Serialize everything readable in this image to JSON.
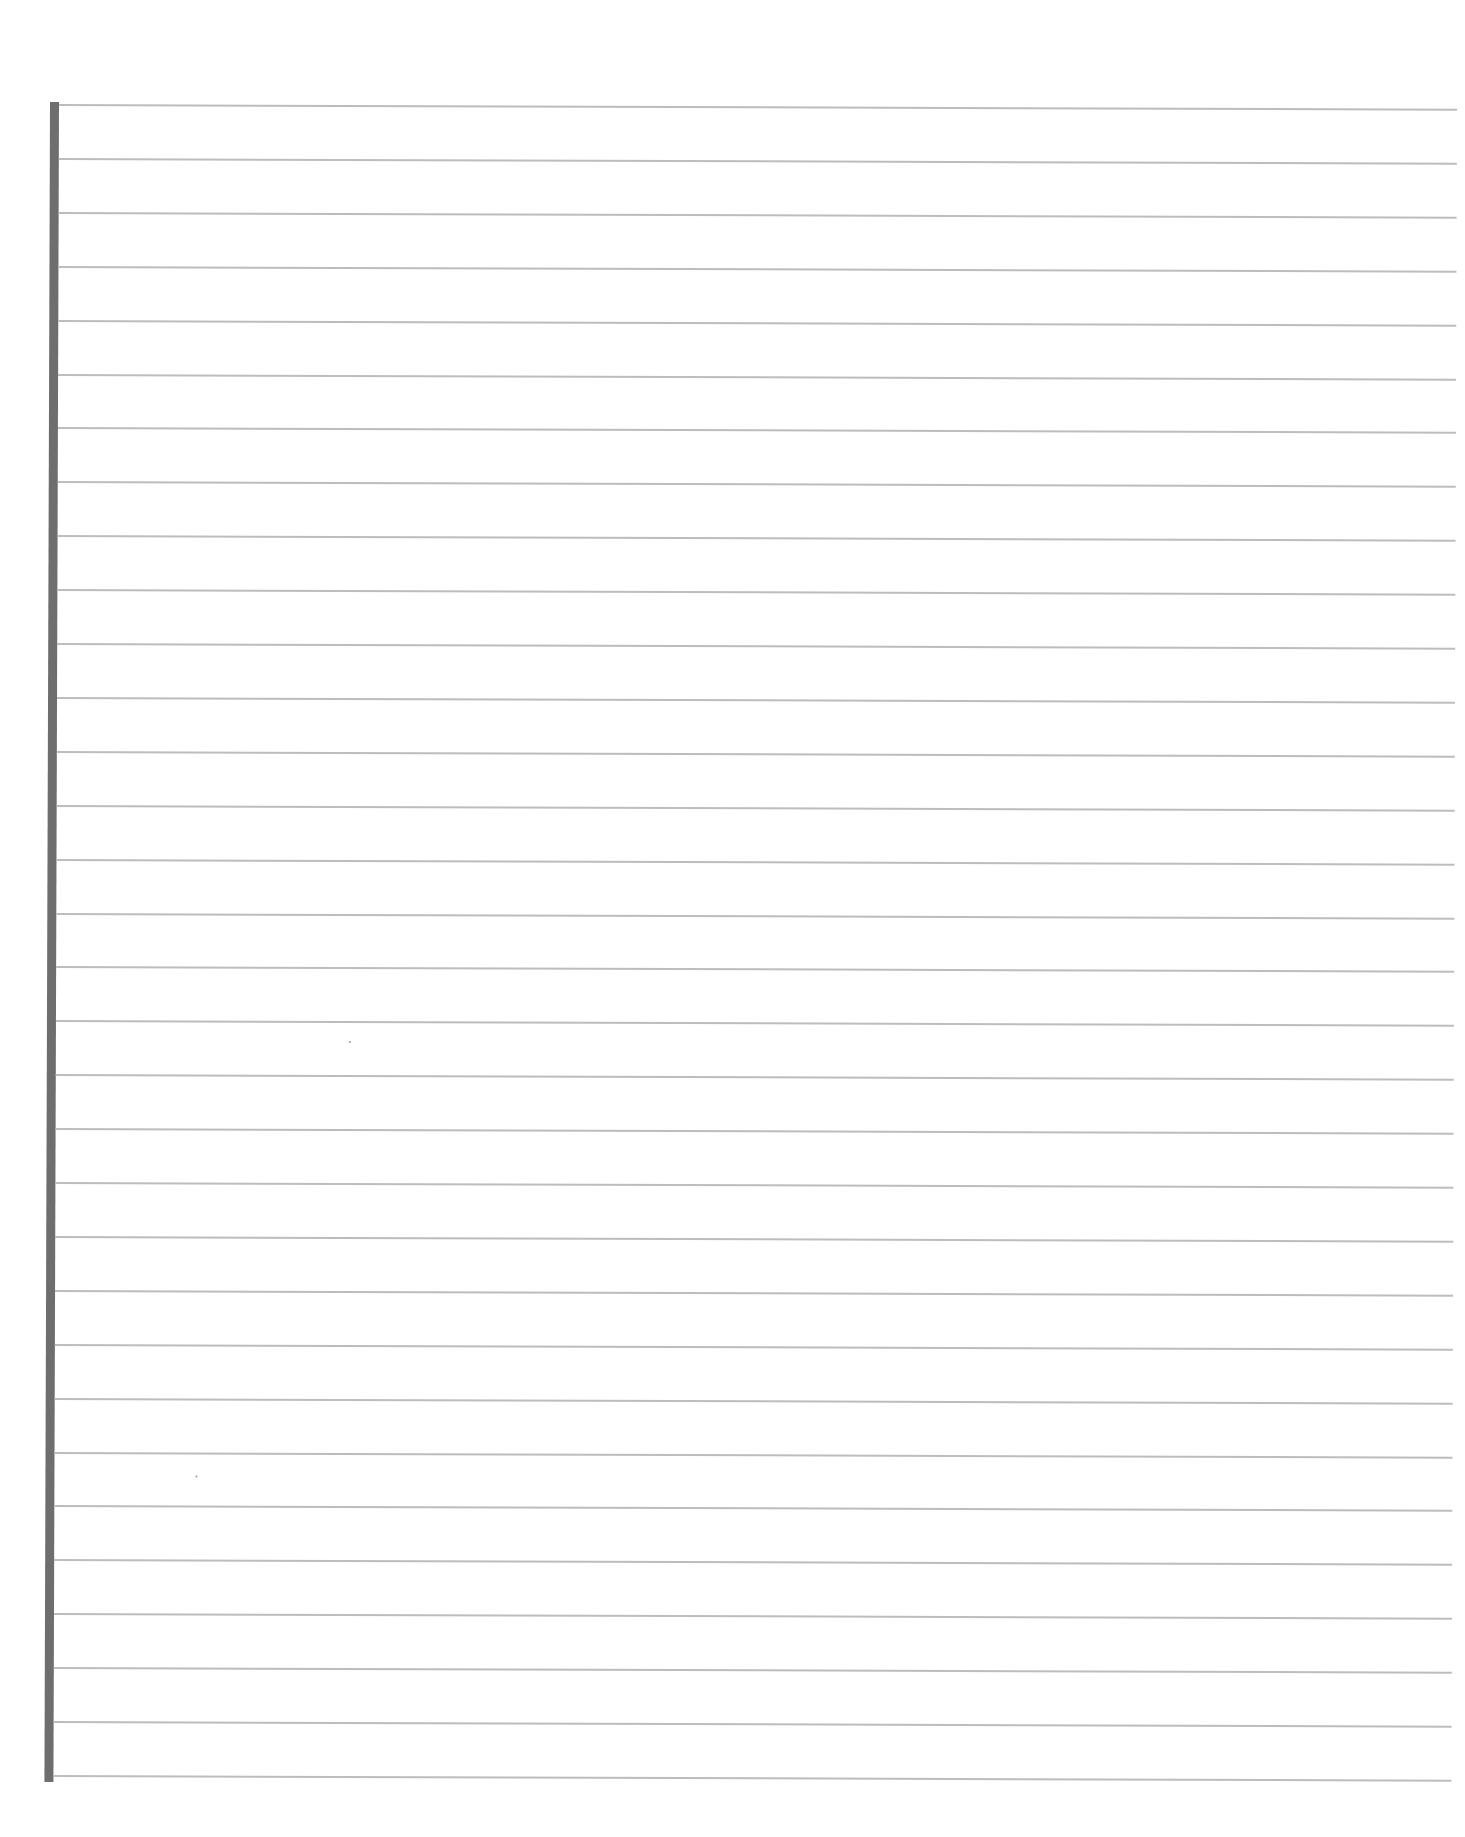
{
  "document": {
    "type": "lined-paper",
    "line_count": 32,
    "first_line_y": 104,
    "line_spacing": 53.9,
    "colors": {
      "paper": "#ffffff",
      "rule": "#bdbdbd",
      "margin_bar": "#6e6e6e"
    },
    "text": ""
  }
}
